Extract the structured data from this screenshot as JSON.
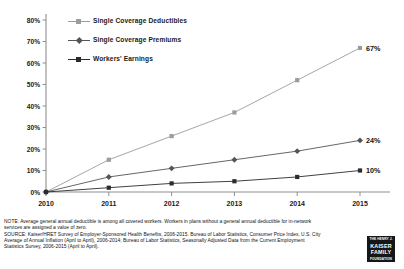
{
  "chart_data": {
    "type": "line",
    "title": "",
    "xlabel": "",
    "ylabel": "",
    "x": [
      2010,
      2011,
      2012,
      2013,
      2014,
      2015
    ],
    "categories": [
      "2010",
      "2011",
      "2012",
      "2013",
      "2014",
      "2015"
    ],
    "xtick_labels": [
      "2010",
      "2011",
      "2012",
      "2013",
      "2014",
      "2015"
    ],
    "ytick_labels": [
      "0%",
      "10%",
      "20%",
      "30%",
      "40%",
      "50%",
      "60%",
      "70%",
      "80%"
    ],
    "ytick_values": [
      0,
      10,
      20,
      30,
      40,
      50,
      60,
      70,
      80
    ],
    "ylim": [
      0,
      80
    ],
    "grid": false,
    "legend_position": "top-center",
    "series": [
      {
        "name": "Single Coverage Deductibles",
        "values": [
          0,
          15,
          26,
          37,
          52,
          67
        ],
        "color": "#9c9c9c",
        "end_label": "67%"
      },
      {
        "name": "Single Coverage Premiums",
        "values": [
          0,
          7,
          11,
          15,
          19,
          24
        ],
        "color": "#555555",
        "end_label": "24%"
      },
      {
        "name": "Workers' Earnings",
        "values": [
          0,
          2,
          4,
          5,
          7,
          10
        ],
        "color": "#2b2b2b",
        "end_label": "10%"
      }
    ]
  },
  "footnotes": {
    "note_lines": [
      "NOTE:  Average general annual deductible  is among  all covered workers. Workers in plans without a general annual deductible for in-network",
      "services are assigned a value of zero."
    ],
    "source_lines": [
      "SOURCE:  Kaiser/HRET Survey of Employer-Sponsored Health Benefits, 2006-2015.  Bureau of Labor Statistics, Consumer Price Index, U.S. City",
      "Average of Annual Inflation (April to April), 2006-2014; Bureau of Labor Statistics, Seasonally Adjusted Data from the Current Employment",
      "Statistics Survey, 2006-2015 (April to April)."
    ]
  },
  "logo": {
    "top": "THE HENRY J.",
    "line1": "KAISER",
    "line2": "FAMILY",
    "line3": "FOUNDATION"
  }
}
